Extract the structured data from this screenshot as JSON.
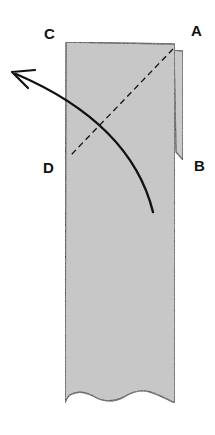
{
  "diagram": {
    "labels": {
      "c": "C",
      "a": "A",
      "d": "D",
      "b": "B"
    },
    "colors": {
      "paper_fill": "#c4c4c4",
      "outline": "#111111",
      "background": "#ffffff"
    }
  }
}
